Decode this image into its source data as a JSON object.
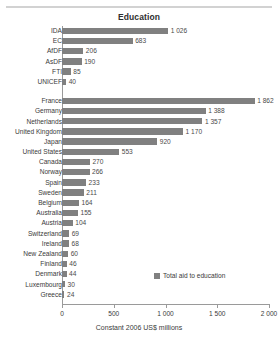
{
  "chart_data": {
    "type": "bar",
    "orientation": "horizontal",
    "title": "Education",
    "xlabel": "Constant 2006 US$ millions",
    "ylabel": "",
    "xlim": [
      0,
      2000
    ],
    "xticks": [
      0,
      500,
      1000,
      1500,
      2000
    ],
    "xticklabels": [
      "0",
      "500",
      "1 000",
      "1 500",
      "2 000"
    ],
    "grid": false,
    "legend": {
      "position": "bottom-right",
      "entries": [
        {
          "label": "Total aid to education",
          "color": "#808080"
        }
      ]
    },
    "groups": [
      {
        "name": "multilateral",
        "categories": [
          "IDA",
          "EC",
          "AfDF",
          "AsDF",
          "FTI",
          "UNICEF"
        ],
        "values": [
          1026,
          683,
          206,
          190,
          85,
          40
        ],
        "value_labels": [
          "1 026",
          "683",
          "206",
          "190",
          "85",
          "40"
        ]
      },
      {
        "name": "bilateral",
        "categories": [
          "France",
          "Germany",
          "Netherlands",
          "United Kingdom",
          "Japan",
          "United States",
          "Canada",
          "Norway",
          "Spain",
          "Sweden",
          "Belgium",
          "Australia",
          "Austria",
          "Switzerland",
          "Ireland",
          "New Zealand",
          "Finland",
          "Denmark",
          "Luxembourg",
          "Greece"
        ],
        "values": [
          1862,
          1388,
          1357,
          1170,
          920,
          553,
          270,
          266,
          233,
          211,
          164,
          155,
          104,
          69,
          68,
          60,
          46,
          44,
          30,
          24
        ],
        "value_labels": [
          "1 862",
          "1 388",
          "1 357",
          "1 170",
          "920",
          "553",
          "270",
          "266",
          "233",
          "211",
          "164",
          "155",
          "104",
          "69",
          "68",
          "60",
          "46",
          "44",
          "30",
          "24"
        ]
      }
    ],
    "bar_color": "#808080"
  },
  "colors": {
    "bar": "#808080",
    "axis": "#9a9a9a",
    "rule": "#d2d2d2",
    "text": "#3a3a3a"
  }
}
